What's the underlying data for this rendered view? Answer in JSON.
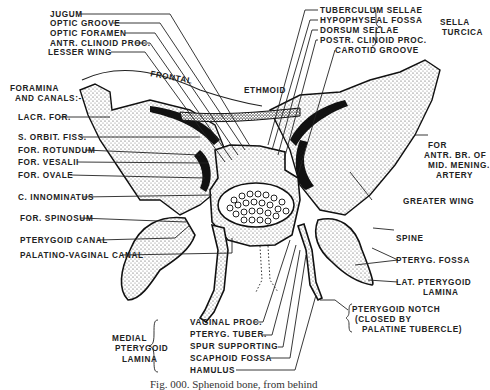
{
  "figure": {
    "caption": "Fig. 000. Sphenoid bone, from behind",
    "labels": {
      "jugum": "JUGUM",
      "optic_groove": "OPTIC GROOVE",
      "optic_foramen": "OPTIC FORAMEN",
      "antr_clinoid": "ANTR. CLINOID PROC.",
      "lesser_wing": "LESSER WING",
      "frontal": "FRONTAL",
      "ethmoid": "ETHMOID",
      "foramina_1": "FORAMINA",
      "foramina_2": "AND CANALS:-",
      "lacr_for": "LACR. FOR.",
      "s_orbit_fiss": "S. ORBIT. FISS.",
      "for_rotundum": "FOR. ROTUNDUM",
      "for_vesalii": "FOR. VESALII",
      "for_ovale": "FOR. OVALE",
      "c_innominatus": "C. INNOMINATUS",
      "for_spinosum": "FOR. SPINOSUM",
      "pterygoid_canal": "PTERYGOID CANAL",
      "palatino_vaginal": "PALATINO-VAGINAL CANAL",
      "tuberculum_sellae": "TUBERCULUM SELLAE",
      "hypophyseal_fossa": "HYPOPHYSEAL FOSSA",
      "dorsum_sellae": "DORSUM SELLAE",
      "postr_clinoid": "POSTR. CLINOID PROC.",
      "carotid_groove": "CAROTID GROOVE",
      "sella_1": "SELLA",
      "sella_2": "TURCICA",
      "for_antr_1": "FOR",
      "for_antr_2": "ANTR. BR. OF",
      "for_antr_3": "MID. MENING.",
      "for_antr_4": "ARTERY",
      "greater_wing": "GREATER WING",
      "spine": "SPINE",
      "pteryg_fossa": "PTERYG. FOSSA",
      "lat_pterygoid_1": "LAT. PTERYGOID",
      "lat_pterygoid_2": "LAMINA",
      "pterygoid_notch_1": "PTERYGOID NOTCH",
      "pterygoid_notch_2": "(CLOSED BY",
      "pterygoid_notch_3": "PALATINE TUBERCLE)",
      "vaginal_proc": "VAGINAL PROC.",
      "pteryg_tuber": "PTERYG. TUBER.",
      "spur_supporting": "SPUR SUPPORTING",
      "scaphoid_fossa": "SCAPHOID FOSSA",
      "hamulus": "HAMULUS",
      "medial_1": "MEDIAL",
      "medial_2": "PTERYGOID",
      "medial_3": "LAMINA"
    }
  }
}
